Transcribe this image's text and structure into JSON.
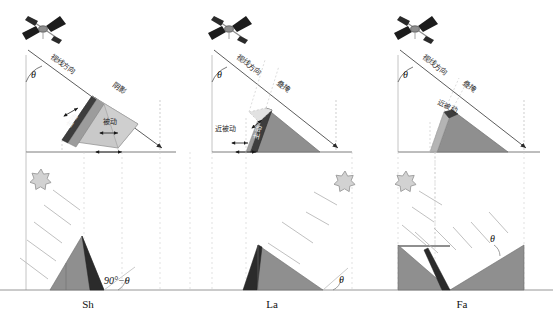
{
  "figure": {
    "background_color": "#ffffff",
    "panel_count": 6,
    "columns": 3,
    "rows": 2
  },
  "colors": {
    "terrain_light": "#c9c9c9",
    "terrain_mid": "#8f8f8f",
    "terrain_dark": "#3a3a3a",
    "terrain_shadow": "#2b2b2b",
    "active_band": "#3d3d3d",
    "passive_band": "#c0c0c0",
    "sun_fill": "#d2d2d2",
    "sun_stroke": "#9a9a9a",
    "line": "#555555",
    "guide": "#a8a8a8",
    "satellite_body": "#777777",
    "satellite_panel": "#1c1c1c",
    "text": "#1a1a1a"
  },
  "panels": [
    {
      "id": "sh",
      "column": 1,
      "bottom_label": "Sh",
      "radar": {
        "los_label": "视线方向",
        "incidence_angle_label": "θ",
        "distortion_label": "阴影",
        "active_label": "主动",
        "passive_label": "被动",
        "slope_angle_label": "90°−θ"
      },
      "optical": {
        "sun_position": "left",
        "ray_direction": "down-right",
        "angle_label": "90°−θ",
        "terrain_shape": "triangular-hill",
        "lit_side": "left",
        "shadow_side": "right"
      }
    },
    {
      "id": "la",
      "column": 2,
      "bottom_label": "La",
      "radar": {
        "los_label": "视线方向",
        "incidence_angle_label": "θ",
        "distortion_label": "叠掩",
        "active_label": "主动",
        "passive_label": "近被动",
        "slope_angle_label": "θ"
      },
      "optical": {
        "sun_position": "right",
        "ray_direction": "down-left",
        "angle_label": "θ",
        "terrain_shape": "triangular-hill",
        "lit_side": "right",
        "shadow_side": "left"
      }
    },
    {
      "id": "fa",
      "column": 3,
      "bottom_label": "Fa",
      "radar": {
        "los_label": "视线方向",
        "incidence_angle_label": "θ",
        "distortion_label": "叠掩",
        "active_label": "",
        "passive_label": "近被动",
        "slope_angle_label": "θ"
      },
      "optical": {
        "sun_position": "left",
        "ray_direction": "down-right",
        "angle_label": "θ",
        "terrain_shape": "valley-notch",
        "lit_side": "right",
        "shadow_side": "left"
      }
    }
  ],
  "glyphs": {
    "satellite": "satellite-icon",
    "sun": "sun-icon",
    "arrow": "arrow-icon"
  }
}
